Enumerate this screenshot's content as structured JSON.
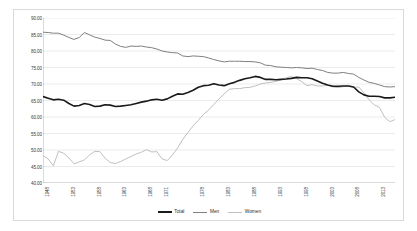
{
  "chart_data": {
    "type": "line",
    "title": "",
    "subtitle": "",
    "xlabel": "",
    "ylabel": "",
    "ylim": [
      40.0,
      90.0
    ],
    "ytick_step": 5.0,
    "ytick_labels": [
      "90.00",
      "85.00",
      "80.00",
      "75.00",
      "70.00",
      "65.00",
      "60.00",
      "55.00",
      "50.00",
      "45.00",
      "40.00"
    ],
    "ytick_values": [
      90.0,
      85.0,
      80.0,
      75.0,
      70.0,
      65.0,
      60.0,
      55.0,
      50.0,
      45.0,
      40.0
    ],
    "grid": true,
    "grid_axis": "y",
    "legend_position": "bottom",
    "xlim": [
      1948,
      2016
    ],
    "xtick_labels": [
      "1948",
      "1953",
      "1958",
      "1963",
      "1968",
      "1971",
      "1978",
      "1983",
      "1988",
      "1993",
      "1998",
      "2003",
      "2008",
      "2013"
    ],
    "xtick_years": [
      1948,
      1953,
      1958,
      1963,
      1968,
      1971,
      1978,
      1983,
      1988,
      1993,
      1998,
      2003,
      2008,
      2013
    ],
    "x": [
      1948,
      1949,
      1950,
      1951,
      1952,
      1953,
      1954,
      1955,
      1956,
      1957,
      1958,
      1959,
      1960,
      1961,
      1962,
      1963,
      1964,
      1965,
      1966,
      1967,
      1968,
      1969,
      1970,
      1971,
      1972,
      1973,
      1974,
      1975,
      1976,
      1977,
      1978,
      1979,
      1980,
      1981,
      1982,
      1983,
      1984,
      1985,
      1986,
      1987,
      1988,
      1989,
      1990,
      1991,
      1992,
      1993,
      1994,
      1995,
      1996,
      1997,
      1998,
      1999,
      2000,
      2001,
      2002,
      2003,
      2004,
      2005,
      2006,
      2007,
      2008,
      2009,
      2010,
      2011,
      2012,
      2013,
      2014,
      2015,
      2016
    ],
    "series": [
      {
        "name": "Total",
        "color": "#1a1a1a",
        "width": 1.6,
        "values": [
          66.2,
          65.7,
          65.2,
          65.4,
          65.1,
          64.1,
          63.3,
          63.5,
          64.1,
          63.8,
          63.2,
          63.3,
          63.7,
          63.6,
          63.2,
          63.3,
          63.5,
          63.7,
          64.1,
          64.5,
          64.8,
          65.2,
          65.4,
          65.1,
          65.5,
          66.3,
          67.0,
          66.9,
          67.4,
          68.1,
          69.0,
          69.5,
          69.6,
          70.1,
          69.7,
          69.5,
          70.1,
          70.5,
          71.1,
          71.6,
          71.9,
          72.3,
          72.0,
          71.4,
          71.4,
          71.3,
          71.4,
          71.5,
          71.7,
          72.0,
          71.9,
          71.9,
          71.6,
          70.9,
          70.2,
          69.7,
          69.3,
          69.3,
          69.4,
          69.4,
          69.1,
          67.6,
          66.7,
          66.3,
          66.3,
          66.2,
          65.8,
          65.8,
          66.0
        ]
      },
      {
        "name": "Men",
        "color": "#808080",
        "width": 1.0,
        "values": [
          85.7,
          85.6,
          85.4,
          85.4,
          84.8,
          84.1,
          83.5,
          84.1,
          85.6,
          84.9,
          84.2,
          83.8,
          83.3,
          83.2,
          82.1,
          81.4,
          81.1,
          81.5,
          81.4,
          81.5,
          81.2,
          81.0,
          80.6,
          80.0,
          79.7,
          79.5,
          79.4,
          78.5,
          78.3,
          78.5,
          78.4,
          78.3,
          77.9,
          77.4,
          77.0,
          76.7,
          76.9,
          76.9,
          76.9,
          76.8,
          76.8,
          76.7,
          76.4,
          75.7,
          75.6,
          75.2,
          75.1,
          75.0,
          74.9,
          75.0,
          74.9,
          74.7,
          74.8,
          74.4,
          74.1,
          73.5,
          73.3,
          73.3,
          73.5,
          73.2,
          73.0,
          72.0,
          71.2,
          70.5,
          70.2,
          69.7,
          69.2,
          69.1,
          69.2
        ]
      },
      {
        "name": "Women",
        "color": "#c0c0c0",
        "width": 1.0,
        "values": [
          48.3,
          47.3,
          45.2,
          49.6,
          49.0,
          47.6,
          45.8,
          46.4,
          47.0,
          48.5,
          49.6,
          49.5,
          47.5,
          46.2,
          45.9,
          46.5,
          47.3,
          48.0,
          48.8,
          49.3,
          50.1,
          49.4,
          49.5,
          47.3,
          46.8,
          48.5,
          50.6,
          53.2,
          55.3,
          57.3,
          59.0,
          60.8,
          62.1,
          63.8,
          65.5,
          67.0,
          68.4,
          68.6,
          68.6,
          68.9,
          69.0,
          69.4,
          70.0,
          70.3,
          70.5,
          70.8,
          71.3,
          71.9,
          72.3,
          71.6,
          70.7,
          69.5,
          69.8,
          69.4,
          69.4,
          69.6,
          69.1,
          68.9,
          69.2,
          69.5,
          69.0,
          69.1,
          67.3,
          65.2,
          63.7,
          62.9,
          59.9,
          58.6,
          59.2
        ]
      }
    ]
  },
  "legend": {
    "items": [
      {
        "label": "Total"
      },
      {
        "label": "Men"
      },
      {
        "label": "Women"
      }
    ]
  }
}
